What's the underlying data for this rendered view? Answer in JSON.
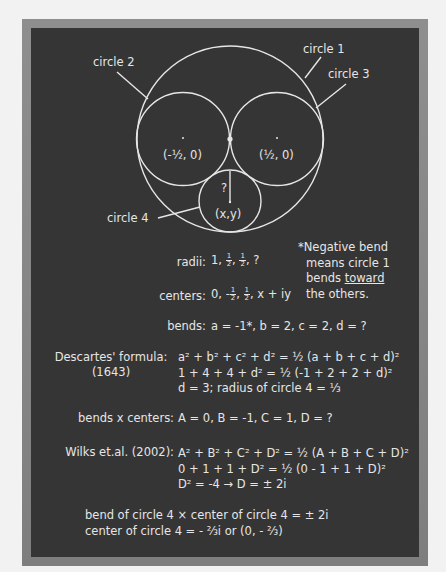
{
  "colors": {
    "page_bg": "#f2f2f2",
    "frame": "#888888",
    "board": "#353535",
    "chalk": "#e6e6e6"
  },
  "diagram": {
    "labels": {
      "circle1": "circle 1",
      "circle2": "circle 2",
      "circle3": "circle 3",
      "circle4": "circle 4"
    },
    "centers": {
      "left": "(-½, 0)",
      "right": "(½, 0)",
      "bottom": "(x,y)",
      "unknown_radius": "?"
    },
    "circles": [
      {
        "name": "circle 1",
        "cx": 230,
        "cy": 139,
        "r": 93
      },
      {
        "name": "circle 2",
        "cx": 183,
        "cy": 139,
        "r": 46.5
      },
      {
        "name": "circle 3",
        "cx": 277,
        "cy": 139,
        "r": 46.5
      },
      {
        "name": "circle 4",
        "cx": 230,
        "cy": 201,
        "r": 31
      }
    ]
  },
  "note": {
    "line1": "*Negative bend",
    "line2": "means circle 1",
    "line3_pre": "bends ",
    "line3_u": "toward",
    "line4": "the others."
  },
  "rows": {
    "radii": {
      "label": "radii:",
      "pre": "1, ",
      "f1n": "1",
      "f1d": "2",
      "mid": ", ",
      "f2n": "1",
      "f2d": "2",
      "post": ", ?"
    },
    "centers": {
      "label": "centers:",
      "pre": "0, -",
      "f1n": "1",
      "f1d": "2",
      "mid": ", ",
      "f2n": "1",
      "f2d": "2",
      "post": ", x + iy"
    },
    "bends": {
      "label": "bends:",
      "value": "a = -1*, b = 2, c = 2, d = ?"
    },
    "descartes": {
      "label": "Descartes' formula:",
      "year": "(1643)",
      "line1": "a² + b² + c² + d² = ½ (a + b + c + d)²",
      "line2": "1 + 4 + 4 + d² = ½ (-1 + 2 + 2 + d)²",
      "line3": "d = 3; radius of circle 4 = ⅓"
    },
    "bends_centers": {
      "label": "bends x centers:",
      "value": "A = 0, B = -1, C = 1, D = ?"
    },
    "wilks": {
      "label": "Wilks et.al. (2002):",
      "line1": "A² + B² + C² + D² = ½ (A + B + C + D)²",
      "line2": "0 + 1 + 1 + D² = ½ (0 - 1 + 1 + D)²",
      "line3": "D² = -4 → D = ± 2i"
    },
    "conclusion": {
      "line1": "bend of circle 4 × center of circle 4 = ± 2i",
      "line2": "center of circle 4 = - ⅔i or (0, - ⅔)"
    }
  }
}
